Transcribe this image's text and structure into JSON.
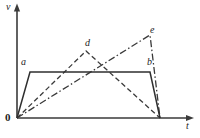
{
  "figure": {
    "kind": "velocity-time-diagram",
    "background_color": "#ffffff",
    "ink_color": "#333333",
    "axes": {
      "vertical_label": "v",
      "horizontal_label": "t",
      "origin_label": "0",
      "vertical": {
        "x": 17,
        "y_bottom": 118,
        "y_top": 6,
        "arrow": true
      },
      "horizontal": {
        "y": 118,
        "x_left": 17,
        "x_right": 194,
        "arrow": true
      }
    },
    "point_labels": [
      {
        "id": "a",
        "text": "a",
        "x": 21,
        "y": 57
      },
      {
        "id": "b",
        "text": "b",
        "x": 147,
        "y": 57
      },
      {
        "id": "d",
        "text": "d",
        "x": 85,
        "y": 38
      },
      {
        "id": "e",
        "text": "e",
        "x": 150,
        "y": 25
      }
    ],
    "curves": [
      {
        "id": "trapezoid-ab",
        "style": "solid",
        "label": "a-b",
        "points": "17,118 30,72 150,72 160,118"
      },
      {
        "id": "triangle-d",
        "style": "dashed",
        "label": "d",
        "points": "17,118 86,51 160,118"
      },
      {
        "id": "triangle-e",
        "style": "dash-dot",
        "label": "e",
        "points": "17,118 150,35 160,118"
      }
    ]
  },
  "chart_data": {
    "type": "line",
    "title": "",
    "xlabel": "t",
    "ylabel": "v",
    "grid": false,
    "legend": false,
    "axis_origin_label": "0",
    "annotations": [
      "a",
      "b",
      "d",
      "e"
    ],
    "series": [
      {
        "name": "a-b",
        "style": "solid",
        "x": [
          0,
          0.073,
          0.751,
          0.808
        ],
        "y": [
          0,
          0.405,
          0.405,
          0
        ]
      },
      {
        "name": "d",
        "style": "dashed",
        "x": [
          0,
          0.39,
          0.808
        ],
        "y": [
          0,
          0.589,
          0
        ]
      },
      {
        "name": "e",
        "style": "dash-dot",
        "x": [
          0,
          0.751,
          0.808
        ],
        "y": [
          0,
          0.728,
          0
        ]
      }
    ],
    "xlim": [
      0,
      1
    ],
    "ylim": [
      0,
      1
    ]
  }
}
